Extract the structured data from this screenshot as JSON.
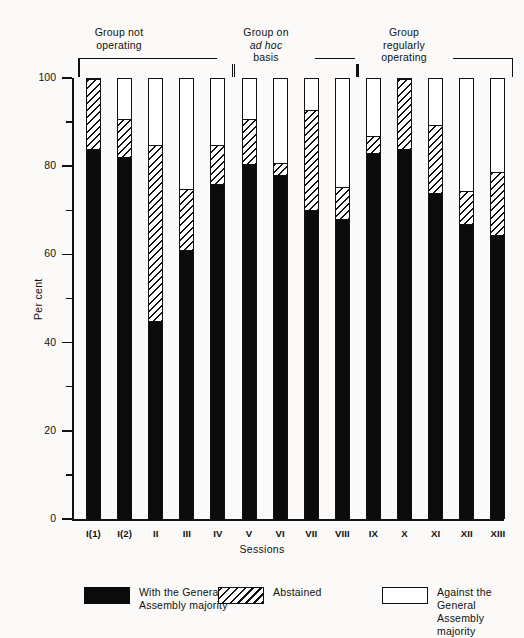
{
  "chart_data": {
    "type": "bar",
    "title": "",
    "xlabel": "Sessions",
    "ylabel": "Per cent",
    "ylim": [
      0,
      100
    ],
    "grid": false,
    "legend_position": "bottom",
    "stacked": true,
    "categories": [
      "I(1)",
      "I(2)",
      "II",
      "III",
      "IV",
      "V",
      "VI",
      "VII",
      "VIII",
      "IX",
      "X",
      "XI",
      "XII",
      "XIII"
    ],
    "y_ticks_major": [
      0,
      20,
      40,
      60,
      80,
      100
    ],
    "y_ticks_minor": [
      10,
      30,
      50,
      70,
      90
    ],
    "series": [
      {
        "name": "With the General Assembly majority",
        "pattern": "solid-black",
        "color": "#0b0b0b",
        "values": [
          84,
          82,
          45,
          61,
          76,
          80.5,
          78,
          70,
          68,
          83,
          84,
          74,
          67,
          64.5
        ]
      },
      {
        "name": "Abstained",
        "pattern": "diagonal-hatch",
        "color": "#ffffff",
        "values": [
          16,
          9,
          40,
          14,
          9,
          10.5,
          3,
          23,
          7.5,
          4,
          16,
          15.5,
          7.5,
          14.5
        ]
      },
      {
        "name": "Against the General Assembly majority",
        "pattern": "white",
        "color": "#ffffff",
        "values": [
          0,
          9,
          15,
          25,
          15,
          9,
          19,
          7,
          24.5,
          13,
          0,
          10.5,
          25.5,
          21
        ]
      }
    ],
    "cumulative_tops": {
      "with_majority": [
        84,
        82,
        45,
        61,
        76,
        80.5,
        78,
        70,
        68,
        83,
        84,
        74,
        67,
        64.5
      ],
      "abstained_top": [
        100,
        91,
        85,
        75,
        85,
        91,
        81,
        93,
        75.5,
        87,
        100,
        89.5,
        74.5,
        79
      ]
    },
    "annotations": {
      "groups": [
        {
          "label_line1": "Group not",
          "label_line2": "operating",
          "italic": "",
          "categories": [
            "I(1)",
            "I(2)",
            "II",
            "III",
            "IV"
          ]
        },
        {
          "label_line1": "Group on",
          "label_line2": "basis",
          "italic": "ad hoc",
          "categories": [
            "V",
            "VI",
            "VII",
            "VIII"
          ]
        },
        {
          "label_line1": "Group",
          "label_line2": "operating",
          "italic_none": "regularly",
          "categories": [
            "IX",
            "X",
            "XI",
            "XII",
            "XIII"
          ]
        }
      ]
    }
  },
  "groups": [
    {
      "id": "group-not-operating",
      "line1": "Group not",
      "line2": "operating",
      "line3": ""
    },
    {
      "id": "group-ad-hoc",
      "line1": "Group on",
      "line2": "ad hoc",
      "line3": "basis"
    },
    {
      "id": "group-regularly-operating",
      "line1": "Group",
      "line2": "regularly",
      "line3": "operating"
    }
  ],
  "axes": {
    "y_label": "Per cent",
    "x_label": "Sessions",
    "y_tick_labels": [
      "100",
      "80",
      "60",
      "40",
      "20",
      "0"
    ]
  },
  "legend": [
    {
      "id": "legend-with-majority",
      "swatch": "black",
      "line1": "With the General",
      "line2": "Assembly majority"
    },
    {
      "id": "legend-abstained",
      "swatch": "hatch",
      "line1": "Abstained",
      "line2": ""
    },
    {
      "id": "legend-against-majority",
      "swatch": "white",
      "line1": "Against the General",
      "line2": "Assembly majority"
    }
  ],
  "colors": {
    "ink": "#111111",
    "paper": "#fbfaf8",
    "black_series": "#0b0b0b",
    "white_series": "#ffffff"
  }
}
